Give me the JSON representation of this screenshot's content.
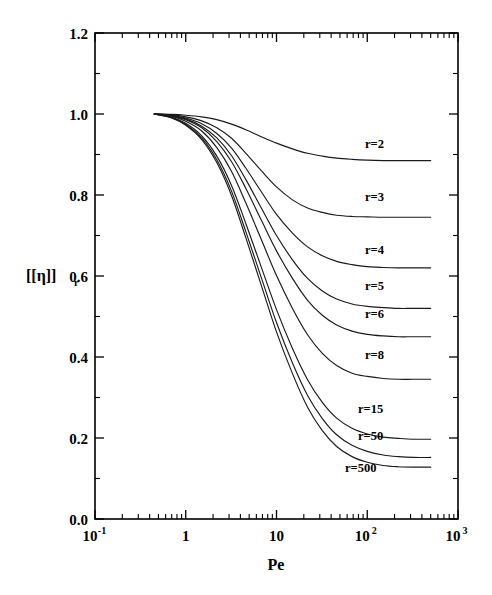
{
  "figure": {
    "background_color": "#ffffff",
    "line_color": "#1a1a1a",
    "axis_color": "#000000"
  },
  "chart_data": {
    "type": "line",
    "title": "",
    "subtitle": "",
    "xlabel": "Pe",
    "ylabel": "[η]",
    "ylabel_subscript": "r",
    "xscale": "log",
    "yscale": "linear",
    "xlim": [
      0.1,
      1000
    ],
    "ylim": [
      0.0,
      1.2
    ],
    "grid": false,
    "legend_position": "inline-right-of-curves",
    "x_tick_labels": [
      "10⁻¹",
      "1",
      "10",
      "10²",
      "10³"
    ],
    "x_tick_values": [
      0.1,
      1,
      10,
      100,
      1000
    ],
    "x_tick_mantissas": [
      "10",
      "1",
      "10",
      "10",
      "10"
    ],
    "x_tick_exponents": [
      "-1",
      "",
      "",
      "2",
      "3"
    ],
    "y_tick_labels": [
      "0.0",
      "0.2",
      "0.4",
      "0.6",
      "0.8",
      "1.0",
      "1.2"
    ],
    "y_tick_values": [
      0.0,
      0.2,
      0.4,
      0.6,
      0.8,
      1.0,
      1.2
    ],
    "y_minor_tick_values": [
      0.1,
      0.3,
      0.5,
      0.7,
      0.9,
      1.1
    ],
    "x_start": 0.45,
    "x_end": 500,
    "series": [
      {
        "name": "r=2",
        "label": "r=2",
        "label_x": 365,
        "label_y": 0.925,
        "plateau": 0.885,
        "midpoint_pe": 6.5,
        "steepness": 0.85,
        "x": [
          0.45,
          0.7,
          1.0,
          1.5,
          2.2,
          3.2,
          4.6,
          6.8,
          10,
          15,
          22,
          32,
          46,
          68,
          100,
          150,
          220,
          320,
          500
        ],
        "y": [
          1.0,
          0.999,
          0.997,
          0.993,
          0.986,
          0.975,
          0.961,
          0.944,
          0.928,
          0.914,
          0.903,
          0.896,
          0.891,
          0.888,
          0.886,
          0.885,
          0.885,
          0.885,
          0.885
        ]
      },
      {
        "name": "r=3",
        "label": "r=3",
        "label_x": 365,
        "label_y": 0.795,
        "plateau": 0.745,
        "midpoint_pe": 5.5,
        "steepness": 0.8,
        "x": [
          0.45,
          0.7,
          1.0,
          1.5,
          2.2,
          3.2,
          4.6,
          6.8,
          10,
          15,
          22,
          32,
          46,
          68,
          100,
          150,
          220,
          320,
          500
        ],
        "y": [
          1.0,
          0.998,
          0.993,
          0.983,
          0.966,
          0.94,
          0.903,
          0.86,
          0.82,
          0.788,
          0.768,
          0.757,
          0.75,
          0.747,
          0.746,
          0.745,
          0.745,
          0.745,
          0.745
        ]
      },
      {
        "name": "r=4",
        "label": "r=4",
        "label_x": 365,
        "label_y": 0.665,
        "plateau": 0.62,
        "midpoint_pe": 5.0,
        "steepness": 0.78,
        "x": [
          0.45,
          0.7,
          1.0,
          1.5,
          2.2,
          3.2,
          4.6,
          6.8,
          10,
          15,
          22,
          32,
          46,
          68,
          100,
          150,
          220,
          320,
          500
        ],
        "y": [
          1.0,
          0.997,
          0.99,
          0.976,
          0.952,
          0.916,
          0.866,
          0.808,
          0.752,
          0.706,
          0.672,
          0.65,
          0.636,
          0.628,
          0.623,
          0.621,
          0.62,
          0.62,
          0.62
        ]
      },
      {
        "name": "r=5",
        "label": "r=5",
        "label_x": 365,
        "label_y": 0.575,
        "plateau": 0.52,
        "midpoint_pe": 4.6,
        "steepness": 0.76,
        "x": [
          0.45,
          0.7,
          1.0,
          1.5,
          2.2,
          3.2,
          4.6,
          6.8,
          10,
          15,
          22,
          32,
          46,
          68,
          100,
          150,
          220,
          320,
          500
        ],
        "y": [
          1.0,
          0.996,
          0.988,
          0.97,
          0.941,
          0.897,
          0.838,
          0.768,
          0.7,
          0.64,
          0.594,
          0.563,
          0.543,
          0.531,
          0.525,
          0.522,
          0.52,
          0.52,
          0.52
        ]
      },
      {
        "name": "r=6",
        "label": "r=6",
        "label_x": 365,
        "label_y": 0.505,
        "plateau": 0.45,
        "midpoint_pe": 4.4,
        "steepness": 0.74,
        "x": [
          0.45,
          0.7,
          1.0,
          1.5,
          2.2,
          3.2,
          4.6,
          6.8,
          10,
          15,
          22,
          32,
          46,
          68,
          100,
          150,
          220,
          320,
          500
        ],
        "y": [
          1.0,
          0.995,
          0.986,
          0.966,
          0.932,
          0.882,
          0.816,
          0.738,
          0.662,
          0.594,
          0.54,
          0.503,
          0.479,
          0.464,
          0.456,
          0.452,
          0.45,
          0.45,
          0.45
        ]
      },
      {
        "name": "r=8",
        "label": "r=8",
        "label_x": 365,
        "label_y": 0.405,
        "plateau": 0.345,
        "midpoint_pe": 4.0,
        "steepness": 0.72,
        "x": [
          0.45,
          0.7,
          1.0,
          1.5,
          2.2,
          3.2,
          4.6,
          6.8,
          10,
          15,
          22,
          32,
          46,
          68,
          100,
          150,
          220,
          320,
          500
        ],
        "y": [
          1.0,
          0.994,
          0.982,
          0.958,
          0.917,
          0.858,
          0.78,
          0.69,
          0.601,
          0.52,
          0.455,
          0.409,
          0.379,
          0.36,
          0.352,
          0.347,
          0.345,
          0.345,
          0.345
        ]
      },
      {
        "name": "r=15",
        "label": "r=15",
        "label_x": 358,
        "label_y": 0.272,
        "plateau": 0.197,
        "midpoint_pe": 3.4,
        "steepness": 0.66,
        "x": [
          0.45,
          0.7,
          1.0,
          1.5,
          2.2,
          3.2,
          4.6,
          6.8,
          10,
          15,
          22,
          32,
          46,
          68,
          100,
          150,
          220,
          320,
          500
        ],
        "y": [
          1.0,
          0.992,
          0.977,
          0.946,
          0.896,
          0.823,
          0.729,
          0.622,
          0.517,
          0.421,
          0.344,
          0.288,
          0.249,
          0.224,
          0.21,
          0.202,
          0.199,
          0.197,
          0.197
        ]
      },
      {
        "name": "r=50",
        "label": "r=50",
        "label_x": 358,
        "label_y": 0.205,
        "plateau": 0.152,
        "midpoint_pe": 3.1,
        "steepness": 0.62,
        "x": [
          0.45,
          0.7,
          1.0,
          1.5,
          2.2,
          3.2,
          4.6,
          6.8,
          10,
          15,
          22,
          32,
          46,
          68,
          100,
          150,
          220,
          320,
          500
        ],
        "y": [
          1.0,
          0.991,
          0.974,
          0.941,
          0.887,
          0.809,
          0.709,
          0.596,
          0.485,
          0.385,
          0.305,
          0.248,
          0.208,
          0.182,
          0.167,
          0.158,
          0.154,
          0.152,
          0.152
        ]
      },
      {
        "name": "r=500",
        "label": "r=500",
        "label_x": 345,
        "label_y": 0.125,
        "plateau": 0.128,
        "midpoint_pe": 2.9,
        "steepness": 0.6,
        "x": [
          0.45,
          0.7,
          1.0,
          1.5,
          2.2,
          3.2,
          4.6,
          6.8,
          10,
          15,
          22,
          32,
          46,
          68,
          100,
          150,
          220,
          320,
          500
        ],
        "y": [
          1.0,
          0.99,
          0.972,
          0.937,
          0.88,
          0.798,
          0.694,
          0.577,
          0.462,
          0.359,
          0.276,
          0.218,
          0.179,
          0.154,
          0.14,
          0.132,
          0.129,
          0.128,
          0.128
        ]
      }
    ]
  }
}
